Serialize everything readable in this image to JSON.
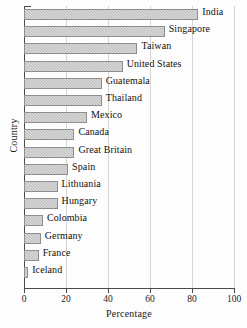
{
  "chart_data": {
    "type": "bar",
    "orientation": "horizontal",
    "title": "",
    "xlabel": "Percentage",
    "ylabel": "Country",
    "xlim": [
      0,
      100
    ],
    "xticks": [
      0,
      20,
      40,
      60,
      80,
      100
    ],
    "xtick_labels": [
      "0",
      "20",
      "40",
      "60",
      "80",
      "100"
    ],
    "grid": "vertical gridlines at each x tick",
    "legend": "none",
    "categories": [
      "India",
      "Singapore",
      "Taiwan",
      "United States",
      "Guatemala",
      "Thailand",
      "Mexico",
      "Canada",
      "Great Britain",
      "Spain",
      "Lithuania",
      "Hungary",
      "Colombia",
      "Germany",
      "France",
      "Iceland"
    ],
    "values": [
      83,
      67,
      54,
      47,
      37,
      37,
      30,
      24,
      24,
      21,
      16,
      16,
      9,
      8,
      7,
      2
    ],
    "bar_color": "#bdbdbd",
    "bar_edge_color": "#8e8e8e",
    "axis_color": "#4a4a4a",
    "grid_color": "#d6d6d6"
  }
}
